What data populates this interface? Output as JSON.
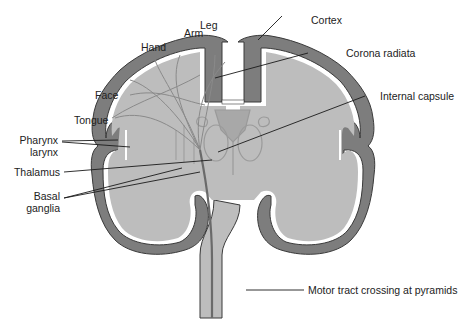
{
  "diagram": {
    "type": "anatomical-illustration",
    "colors": {
      "cortex": "#7d7d7d",
      "white_matter": "#bdbdbd",
      "fibers": "#8a8a8a",
      "outline": "#3a3a3a",
      "ventricle": "#ffffff",
      "leader_line": "#1a1a1a",
      "text": "#222222"
    },
    "labels": {
      "leg": "Leg",
      "arm": "Arm",
      "hand": "Hand",
      "face": "Face",
      "tongue": "Tongue",
      "pharynx_line1": "Pharynx",
      "pharynx_line2": "larynx",
      "thalamus": "Thalamus",
      "basal_line1": "Basal",
      "basal_line2": "ganglia",
      "cortex": "Cortex",
      "corona_radiata": "Corona  radiata",
      "internal_capsule": "Internal capsule",
      "motor_tract": "Motor tract crossing at pyramids"
    }
  }
}
